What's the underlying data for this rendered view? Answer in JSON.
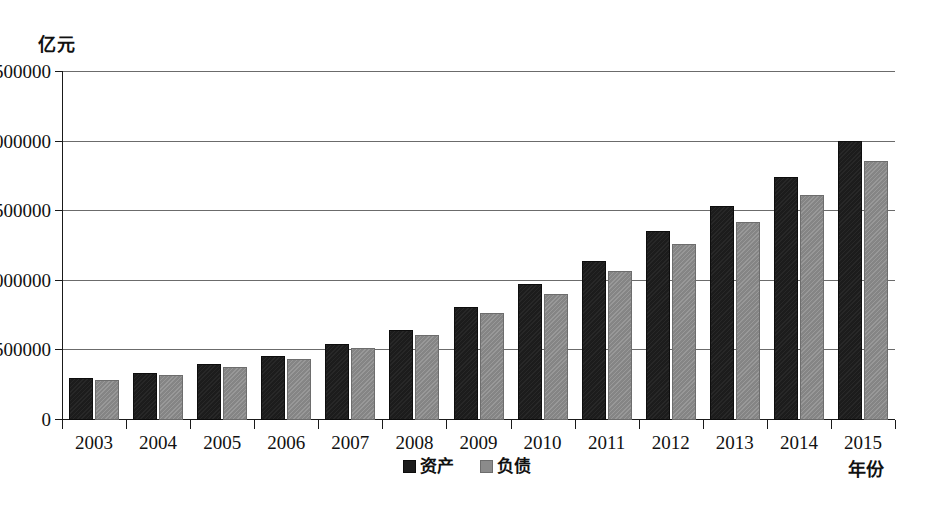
{
  "chart_data": {
    "type": "bar",
    "title": "",
    "subtitle": "",
    "xlabel": "年份",
    "ylabel": "亿元",
    "ylim": [
      0,
      2500000
    ],
    "ytick_values": [
      0,
      500000,
      1000000,
      1500000,
      2000000,
      2500000
    ],
    "ytick_labels": [
      "0",
      "500000",
      "1000000",
      "1500000",
      "2000000",
      "2500000"
    ],
    "grid": true,
    "legend_position": "bottom-center",
    "categories": [
      "2003",
      "2004",
      "2005",
      "2006",
      "2007",
      "2008",
      "2009",
      "2010",
      "2011",
      "2012",
      "2013",
      "2014",
      "2015"
    ],
    "series": [
      {
        "name": "资产",
        "color": "#1c1c1c",
        "values": [
          285000,
          320000,
          385000,
          445000,
          530000,
          630000,
          795000,
          960000,
          1130000,
          1340000,
          1520000,
          1730000,
          1990000
        ]
      },
      {
        "name": "负债",
        "color": "#858585",
        "values": [
          275000,
          310000,
          365000,
          425000,
          500000,
          595000,
          755000,
          890000,
          1055000,
          1250000,
          1410000,
          1600000,
          1845000
        ]
      }
    ]
  },
  "axis": {
    "unit_label": "亿元",
    "x_title": "年份"
  },
  "legend": {
    "items": [
      {
        "label": "资产",
        "swatch": "assets"
      },
      {
        "label": "负债",
        "swatch": "liab"
      }
    ]
  }
}
